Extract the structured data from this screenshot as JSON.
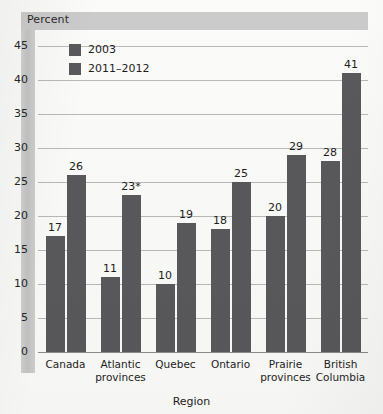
{
  "figure": {
    "axis_header_label": "Percent",
    "xaxis_title": "Region"
  },
  "legend": {
    "items": [
      {
        "label": "2003",
        "color": "#59595b"
      },
      {
        "label": "2011–2012",
        "color": "#59595b"
      }
    ]
  },
  "chart_data": {
    "type": "bar",
    "title": "",
    "subtitle": "",
    "xlabel": "Region",
    "ylabel": "Percent",
    "ylim": [
      0,
      47
    ],
    "yticks": [
      0,
      5,
      10,
      15,
      20,
      25,
      30,
      35,
      40,
      45
    ],
    "ytick_labels": [
      "0",
      "5",
      "10",
      "15",
      "20",
      "25",
      "30",
      "35",
      "40",
      "45"
    ],
    "grid": true,
    "legend_position": "top-left-inside",
    "categories": [
      "Canada",
      "Atlantic provinces",
      "Quebec",
      "Ontario",
      "Prairie provinces",
      "British Columbia"
    ],
    "category_lines": [
      [
        "Canada"
      ],
      [
        "Atlantic",
        "provinces"
      ],
      [
        "Quebec"
      ],
      [
        "Ontario"
      ],
      [
        "Prairie",
        "provinces"
      ],
      [
        "British",
        "Columbia"
      ]
    ],
    "series": [
      {
        "name": "2003",
        "color": "#59595b",
        "values": [
          17,
          11,
          10,
          18,
          20,
          28
        ],
        "data_labels": [
          "17",
          "11",
          "10",
          "18",
          "20",
          "28"
        ]
      },
      {
        "name": "2011–2012",
        "color": "#59595b",
        "values": [
          26,
          23,
          19,
          25,
          29,
          41
        ],
        "data_labels": [
          "26",
          "23*",
          "19",
          "25",
          "29",
          "41"
        ]
      }
    ],
    "annotations": [
      {
        "text": "*",
        "attached_to": "2011–2012 / Atlantic provinces",
        "meaning": "footnote marker on value 23"
      }
    ]
  }
}
